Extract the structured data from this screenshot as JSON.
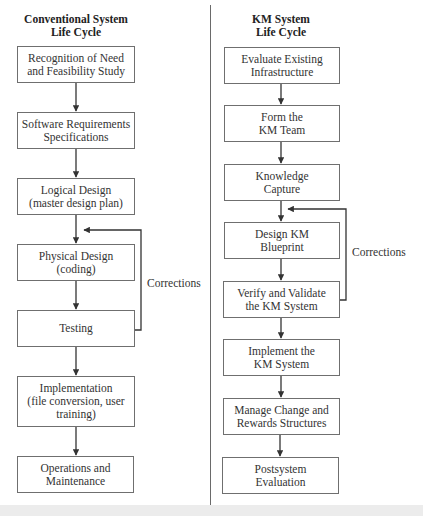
{
  "left_column": {
    "title_line1": "Conventional System",
    "title_line2": "Life Cycle",
    "steps": [
      {
        "line1": "Recognition of Need",
        "line2": "and Feasibility Study"
      },
      {
        "line1": "Software Requirements",
        "line2": "Specifications"
      },
      {
        "line1": "Logical Design",
        "line2": "(master design plan)"
      },
      {
        "line1": "Physical Design",
        "line2": "(coding)"
      },
      {
        "line1": "Testing",
        "line2": ""
      },
      {
        "line1": "Implementation",
        "line2": "(file conversion, user",
        "line3": "training)"
      },
      {
        "line1": "Operations and",
        "line2": "Maintenance"
      }
    ],
    "feedback_label": "Corrections"
  },
  "right_column": {
    "title_line1": "KM System",
    "title_line2": "Life Cycle",
    "steps": [
      {
        "line1": "Evaluate Existing",
        "line2": "Infrastructure"
      },
      {
        "line1": "Form the",
        "line2": "KM Team"
      },
      {
        "line1": "Knowledge",
        "line2": "Capture"
      },
      {
        "line1": "Design KM",
        "line2": "Blueprint"
      },
      {
        "line1": "Verify and Validate",
        "line2": "the KM System"
      },
      {
        "line1": "Implement the",
        "line2": "KM System"
      },
      {
        "line1": "Manage Change and",
        "line2": "Rewards Structures"
      },
      {
        "line1": "Postsystem",
        "line2": "Evaluation"
      }
    ],
    "feedback_label": "Corrections"
  },
  "colors": {
    "line": "#3a3a3a",
    "box_border": "#6f6f6f",
    "text": "#333333",
    "divider": "#6a6a6a",
    "bottom_band": "#ececec"
  }
}
